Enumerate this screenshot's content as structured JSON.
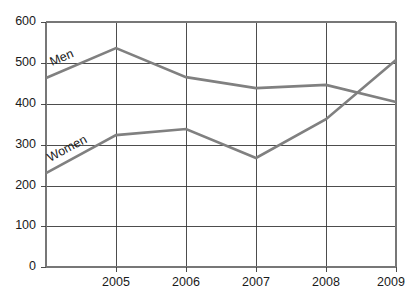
{
  "chart_data": {
    "type": "line",
    "title": "",
    "xlabel": "",
    "ylabel": "",
    "x": [
      "2004",
      "2005",
      "2006",
      "2007",
      "2008",
      "2009"
    ],
    "categories": [
      "2004",
      "2005",
      "2006",
      "2007",
      "2008",
      "2009"
    ],
    "xtick_labels": [
      "2005",
      "2006",
      "2007",
      "2008",
      "2009"
    ],
    "ytick_labels": [
      "0",
      "100",
      "200",
      "300",
      "400",
      "500",
      "600"
    ],
    "yticks": [
      0,
      100,
      200,
      300,
      400,
      500,
      600
    ],
    "ylim": [
      0,
      600
    ],
    "grid": "vertical-and-horizontal",
    "legend": "inline-labels",
    "series": [
      {
        "name": "Men",
        "label": "Men",
        "color": "#808080",
        "values": [
          463,
          536,
          465,
          438,
          446,
          404
        ]
      },
      {
        "name": "Women",
        "label": "Women",
        "color": "#808080",
        "values": [
          230,
          323,
          338,
          267,
          362,
          507
        ]
      }
    ],
    "annotations": [
      {
        "text": "Men",
        "series": "Men"
      },
      {
        "text": "Women",
        "series": "Women"
      }
    ]
  },
  "colors": {
    "line": "#808080",
    "grid": "#3a3a3a",
    "axis": "#777777",
    "text": "#1a1a1a",
    "background": "#ffffff"
  }
}
